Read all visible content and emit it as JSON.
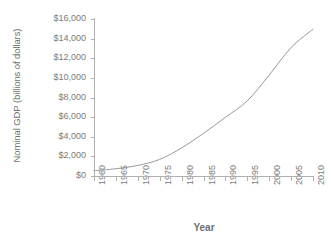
{
  "chart_data": {
    "type": "line",
    "title": "",
    "xlabel": "Year",
    "ylabel": "Nominal GDP (billions of dollars)",
    "x": [
      1960,
      1965,
      1970,
      1975,
      1980,
      1985,
      1990,
      1995,
      2000,
      2005,
      2010
    ],
    "values": [
      540,
      740,
      1075,
      1690,
      2860,
      4350,
      5980,
      7660,
      10290,
      13090,
      14960
    ],
    "series": [
      {
        "name": "Nominal GDP",
        "values": [
          540,
          740,
          1075,
          1690,
          2860,
          4350,
          5980,
          7660,
          10290,
          13090,
          14960
        ]
      }
    ],
    "xtick_labels": [
      "1960",
      "1965",
      "1970",
      "1975",
      "1980",
      "1985",
      "1990",
      "1995",
      "2000",
      "2005",
      "2010"
    ],
    "ytick_labels": [
      "$0",
      "$2,000",
      "$4,000",
      "$6,000",
      "$8,000",
      "$10,000",
      "$12,000",
      "$14,000",
      "$16,000"
    ],
    "ytick_values": [
      0,
      2000,
      4000,
      6000,
      8000,
      10000,
      12000,
      14000,
      16000
    ],
    "xlim": [
      1960,
      2010
    ],
    "ylim": [
      0,
      16000
    ],
    "grid": false,
    "legend": "none",
    "line_color": "#9a9a9a",
    "axis_color": "#b0b0b0",
    "text_color": "#7a7a7a",
    "background_color": "#ffffff"
  }
}
